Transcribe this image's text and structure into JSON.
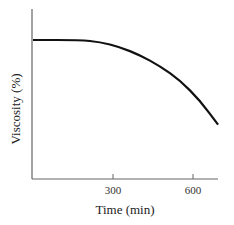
{
  "chart_data": {
    "type": "line",
    "title": "",
    "xlabel": "Time (min)",
    "ylabel": "Viscosity (%)",
    "xlim": [
      0,
      694
    ],
    "xticks": [
      300,
      600
    ],
    "xtick_labels": [
      "300",
      "600"
    ],
    "yticks": [],
    "grid": false,
    "legend": null,
    "series": [
      {
        "name": "viscosity",
        "color": "#111111",
        "x": [
          0,
          176,
          251,
          326,
          401,
          476,
          551,
          626,
          694
        ],
        "y_relative": [
          1.0,
          1.0,
          0.986,
          0.949,
          0.891,
          0.812,
          0.71,
          0.565,
          0.391
        ]
      }
    ]
  },
  "labels": {
    "xlabel": "Time (min)",
    "ylabel": "Viscosity (%)",
    "tick_300": "300",
    "tick_600": "600"
  }
}
